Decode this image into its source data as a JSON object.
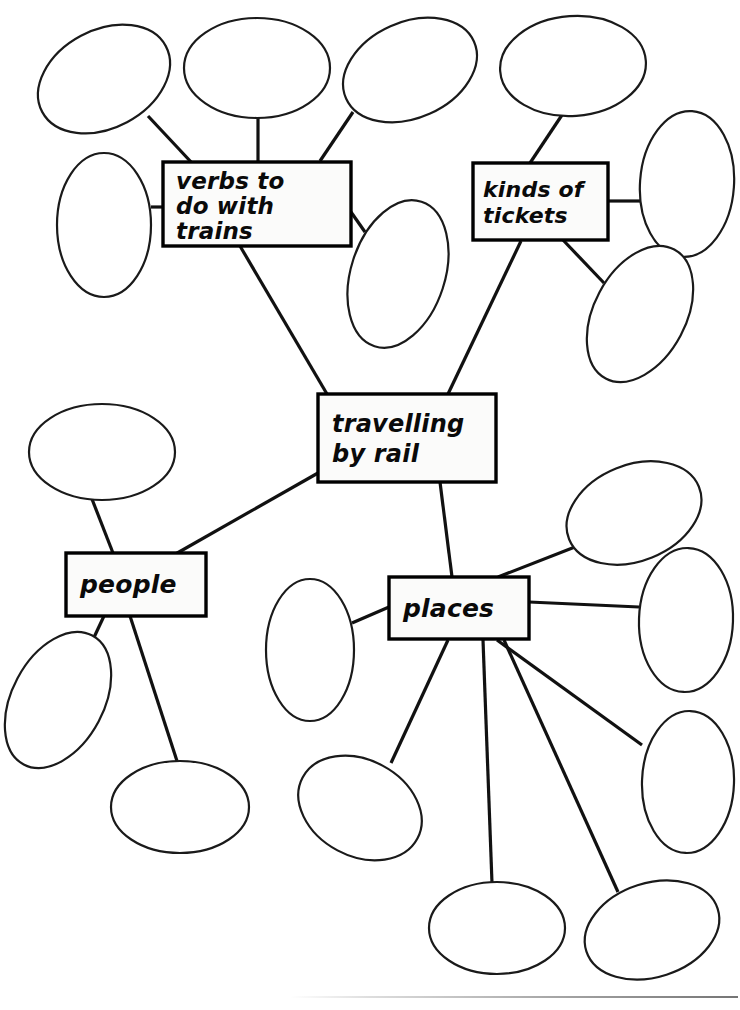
{
  "document": {
    "kind": "hand-drawn-mind-map-worksheet",
    "title": "travelling by rail",
    "background_color": "#ffffff",
    "ink_color": "#111111",
    "width": 740,
    "height": 1010
  },
  "nodes": [
    {
      "id": "verbs",
      "label": "verbs to\ndo with\ntrains",
      "x": 163,
      "y": 162,
      "w": 188,
      "h": 84,
      "font_size": 23,
      "line_height": 25,
      "pad_left": 13,
      "pad_top": 2
    },
    {
      "id": "tickets",
      "label": "kinds of\ntickets",
      "x": 473,
      "y": 163,
      "w": 135,
      "h": 77,
      "font_size": 22,
      "line_height": 26,
      "pad_left": 10,
      "pad_top": 1
    },
    {
      "id": "centre",
      "label": "travelling\nby rail",
      "x": 318,
      "y": 394,
      "w": 178,
      "h": 88,
      "font_size": 24,
      "line_height": 30,
      "pad_left": 14,
      "pad_top": 1
    },
    {
      "id": "people",
      "label": "people",
      "x": 66,
      "y": 553,
      "w": 140,
      "h": 63,
      "font_size": 25,
      "line_height": 27,
      "pad_left": 14,
      "pad_top": 0
    },
    {
      "id": "places",
      "label": "places",
      "x": 389,
      "y": 577,
      "w": 140,
      "h": 62,
      "font_size": 25,
      "line_height": 27,
      "pad_left": 14,
      "pad_top": 0
    }
  ],
  "bubbles": [
    {
      "id": "b01",
      "cx": 104,
      "cy": 79,
      "rx": 70,
      "ry": 49,
      "rot": -28,
      "label": ""
    },
    {
      "id": "b02",
      "cx": 257,
      "cy": 68,
      "rx": 73,
      "ry": 50,
      "rot": 0,
      "label": ""
    },
    {
      "id": "b03",
      "cx": 410,
      "cy": 70,
      "rx": 70,
      "ry": 48,
      "rot": -24,
      "label": ""
    },
    {
      "id": "b04",
      "cx": 573,
      "cy": 66,
      "rx": 73,
      "ry": 50,
      "rot": -4,
      "label": ""
    },
    {
      "id": "b05",
      "cx": 687,
      "cy": 184,
      "rx": 47,
      "ry": 73,
      "rot": 4,
      "label": ""
    },
    {
      "id": "b06",
      "cx": 104,
      "cy": 225,
      "rx": 47,
      "ry": 72,
      "rot": 0,
      "label": ""
    },
    {
      "id": "b07",
      "cx": 398,
      "cy": 274,
      "rx": 47,
      "ry": 76,
      "rot": 18,
      "label": ""
    },
    {
      "id": "b08",
      "cx": 640,
      "cy": 314,
      "rx": 46,
      "ry": 73,
      "rot": 28,
      "label": ""
    },
    {
      "id": "b09",
      "cx": 102,
      "cy": 452,
      "rx": 73,
      "ry": 48,
      "rot": 0,
      "label": ""
    },
    {
      "id": "b10",
      "cx": 58,
      "cy": 700,
      "rx": 46,
      "ry": 73,
      "rot": 28,
      "label": ""
    },
    {
      "id": "b11",
      "cx": 180,
      "cy": 807,
      "rx": 69,
      "ry": 46,
      "rot": 0,
      "label": ""
    },
    {
      "id": "b12",
      "cx": 310,
      "cy": 650,
      "rx": 44,
      "ry": 71,
      "rot": 0,
      "label": ""
    },
    {
      "id": "b13",
      "cx": 360,
      "cy": 808,
      "rx": 65,
      "ry": 48,
      "rot": 28,
      "label": ""
    },
    {
      "id": "b14",
      "cx": 634,
      "cy": 513,
      "rx": 70,
      "ry": 48,
      "rot": -22,
      "label": ""
    },
    {
      "id": "b15",
      "cx": 686,
      "cy": 620,
      "rx": 47,
      "ry": 72,
      "rot": 2,
      "label": ""
    },
    {
      "id": "b16",
      "cx": 688,
      "cy": 782,
      "rx": 46,
      "ry": 71,
      "rot": 2,
      "label": ""
    },
    {
      "id": "b17",
      "cx": 497,
      "cy": 928,
      "rx": 68,
      "ry": 46,
      "rot": 0,
      "label": ""
    },
    {
      "id": "b18",
      "cx": 652,
      "cy": 930,
      "rx": 69,
      "ry": 47,
      "rot": -18,
      "label": ""
    }
  ],
  "edges": [
    {
      "from": "b01",
      "to": "verbs",
      "x1": 148,
      "y1": 116,
      "x2": 192,
      "y2": 163
    },
    {
      "from": "b02",
      "to": "verbs",
      "x1": 258,
      "y1": 118,
      "x2": 258,
      "y2": 162
    },
    {
      "from": "b03",
      "to": "verbs",
      "x1": 353,
      "y1": 112,
      "x2": 320,
      "y2": 161
    },
    {
      "from": "b06",
      "to": "verbs",
      "x1": 151,
      "y1": 207,
      "x2": 163,
      "y2": 207
    },
    {
      "from": "b07",
      "to": "verbs",
      "x1": 365,
      "y1": 232,
      "x2": 351,
      "y2": 212
    },
    {
      "from": "verbs",
      "to": "centre",
      "x1": 240,
      "y1": 246,
      "x2": 327,
      "y2": 394
    },
    {
      "from": "b04",
      "to": "tickets",
      "x1": 562,
      "y1": 115,
      "x2": 530,
      "y2": 163
    },
    {
      "from": "b05",
      "to": "tickets",
      "x1": 640,
      "y1": 201,
      "x2": 608,
      "y2": 201
    },
    {
      "from": "b08",
      "to": "tickets",
      "x1": 604,
      "y1": 283,
      "x2": 563,
      "y2": 240
    },
    {
      "from": "tickets",
      "to": "centre",
      "x1": 521,
      "y1": 241,
      "x2": 448,
      "y2": 394
    },
    {
      "from": "centre",
      "to": "people",
      "x1": 318,
      "y1": 473,
      "x2": 172,
      "y2": 556
    },
    {
      "from": "centre",
      "to": "places",
      "x1": 440,
      "y1": 482,
      "x2": 452,
      "y2": 577
    },
    {
      "from": "b09",
      "to": "people",
      "x1": 90,
      "y1": 494,
      "x2": 113,
      "y2": 553
    },
    {
      "from": "people",
      "to": "b10",
      "x1": 104,
      "y1": 616,
      "x2": 82,
      "y2": 663
    },
    {
      "from": "people",
      "to": "b11",
      "x1": 130,
      "y1": 616,
      "x2": 177,
      "y2": 761
    },
    {
      "from": "b12",
      "to": "places",
      "x1": 352,
      "y1": 623,
      "x2": 389,
      "y2": 607
    },
    {
      "from": "b14",
      "to": "places",
      "x1": 580,
      "y1": 545,
      "x2": 498,
      "y2": 577
    },
    {
      "from": "b15",
      "to": "places",
      "x1": 639,
      "y1": 607,
      "x2": 529,
      "y2": 602
    },
    {
      "from": "places",
      "to": "b13",
      "x1": 448,
      "y1": 640,
      "x2": 391,
      "y2": 763
    },
    {
      "from": "places",
      "to": "b17",
      "x1": 483,
      "y1": 640,
      "x2": 492,
      "y2": 883
    },
    {
      "from": "places",
      "to": "b16",
      "x1": 497,
      "y1": 640,
      "x2": 642,
      "y2": 745
    },
    {
      "from": "places",
      "to": "b18",
      "x1": 504,
      "y1": 640,
      "x2": 618,
      "y2": 892
    }
  ],
  "scan_artifact": {
    "present": true,
    "x": 290,
    "y": 996,
    "width": 448
  }
}
